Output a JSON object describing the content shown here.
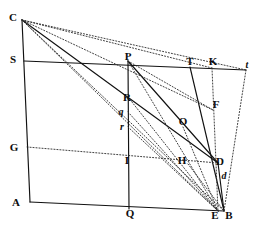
{
  "figure": {
    "background_color": "#ffffff",
    "ink_color": "#111111",
    "width": 266,
    "height": 239
  },
  "labels": [
    {
      "id": "C",
      "text": "C",
      "x": 13,
      "y": 17,
      "style": "roman"
    },
    {
      "id": "S",
      "text": "S",
      "x": 13,
      "y": 59,
      "style": "roman"
    },
    {
      "id": "G",
      "text": "G",
      "x": 14,
      "y": 147,
      "style": "roman"
    },
    {
      "id": "A",
      "text": "A",
      "x": 16,
      "y": 202,
      "style": "roman"
    },
    {
      "id": "P",
      "text": "P",
      "x": 128,
      "y": 56,
      "style": "roman"
    },
    {
      "id": "R",
      "text": "R",
      "x": 127,
      "y": 97,
      "style": "roman"
    },
    {
      "id": "q",
      "text": "q",
      "x": 121,
      "y": 111,
      "style": "italic"
    },
    {
      "id": "r",
      "text": "r",
      "x": 122,
      "y": 126,
      "style": "italic"
    },
    {
      "id": "I",
      "text": "I",
      "x": 127,
      "y": 160,
      "style": "roman"
    },
    {
      "id": "Q",
      "text": "Q",
      "x": 130,
      "y": 213,
      "style": "roman"
    },
    {
      "id": "T",
      "text": "T",
      "x": 190,
      "y": 61,
      "style": "roman"
    },
    {
      "id": "K",
      "text": "K",
      "x": 213,
      "y": 61,
      "style": "roman"
    },
    {
      "id": "t",
      "text": "t",
      "x": 247,
      "y": 64,
      "style": "italic"
    },
    {
      "id": "F",
      "text": "F",
      "x": 216,
      "y": 104,
      "style": "roman"
    },
    {
      "id": "O",
      "text": "O",
      "x": 183,
      "y": 121,
      "style": "roman"
    },
    {
      "id": "H",
      "text": "H",
      "x": 182,
      "y": 160,
      "style": "roman"
    },
    {
      "id": "D",
      "text": "D",
      "x": 220,
      "y": 161,
      "style": "roman"
    },
    {
      "id": "d",
      "text": "d",
      "x": 224,
      "y": 175,
      "style": "italic"
    },
    {
      "id": "E",
      "text": "E",
      "x": 215,
      "y": 215,
      "style": "roman"
    },
    {
      "id": "B",
      "text": "B",
      "x": 229,
      "y": 215,
      "style": "roman"
    }
  ],
  "points": {
    "C": [
      22,
      20
    ],
    "S": [
      24,
      61
    ],
    "G": [
      27,
      147
    ],
    "A": [
      30,
      202
    ],
    "P": [
      128,
      61
    ],
    "R": [
      128,
      97
    ],
    "q": [
      128,
      112
    ],
    "r": [
      128,
      127
    ],
    "I": [
      128,
      160
    ],
    "Q": [
      129,
      209
    ],
    "T": [
      190,
      67
    ],
    "K": [
      212,
      68
    ],
    "t": [
      246,
      70
    ],
    "F": [
      213,
      110
    ],
    "O": [
      183,
      127
    ],
    "H": [
      188,
      164
    ],
    "D": [
      218,
      163
    ],
    "d": [
      220,
      180
    ],
    "E": [
      218,
      211
    ],
    "B": [
      224,
      211
    ]
  },
  "solid_segments": [
    {
      "name": "left-side-CA",
      "from": "C",
      "to": "A"
    },
    {
      "name": "bottom-AB",
      "from": "A",
      "to": "B"
    },
    {
      "name": "horizontal-S-to-t",
      "from": "S",
      "to": "t"
    },
    {
      "name": "vertical-P-to-Q",
      "from": "P",
      "to": "Q"
    },
    {
      "name": "chord-C-to-D",
      "from": "C",
      "to": "D"
    },
    {
      "name": "chord-T-to-B",
      "from": "T",
      "to": "B"
    },
    {
      "name": "chord-P-to-D",
      "from": "P",
      "to": "D"
    },
    {
      "name": "chord-D-to-B",
      "from": "D",
      "to": "B"
    }
  ],
  "dotted_segments": [
    {
      "name": "ray-C-to-t",
      "from": "C",
      "to": "t"
    },
    {
      "name": "ray-C-to-K",
      "from": "C",
      "to": "K"
    },
    {
      "name": "ray-C-to-F",
      "from": "C",
      "to": "F"
    },
    {
      "name": "ray-C-to-B",
      "from": "C",
      "to": "B"
    },
    {
      "name": "ray-C-to-E",
      "from": "C",
      "to": "E"
    },
    {
      "name": "line-G-to-D",
      "from": "G",
      "to": "D"
    },
    {
      "name": "ray-P-to-F",
      "from": "P",
      "to": "F"
    },
    {
      "name": "ray-P-to-E",
      "from": "P",
      "to": "E"
    },
    {
      "name": "ray-R-to-E",
      "from": "R",
      "to": "E"
    },
    {
      "name": "ray-q-to-E",
      "from": "q",
      "to": "E"
    },
    {
      "name": "ray-r-to-E",
      "from": "r",
      "to": "E"
    },
    {
      "name": "ray-K-to-E",
      "from": "K",
      "to": "E"
    },
    {
      "name": "ray-t-to-B",
      "from": "t",
      "to": "B"
    },
    {
      "name": "ray-H-to-B",
      "from": "H",
      "to": "B"
    },
    {
      "name": "ray-O-to-E",
      "from": "O",
      "to": "E"
    }
  ]
}
